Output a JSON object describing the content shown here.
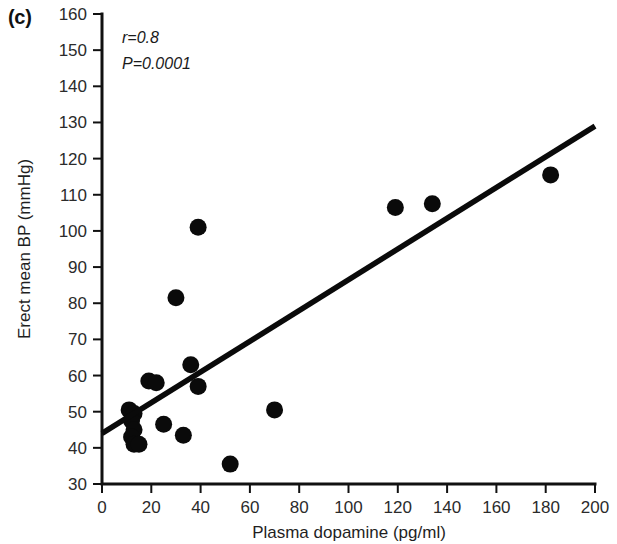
{
  "panel": {
    "label": "(c)"
  },
  "annotations": {
    "correlation": "r=0.8",
    "pvalue": "P=0.0001"
  },
  "axes": {
    "x": {
      "label": "Plasma dopamine (pg/ml)",
      "ticks": [
        "0",
        "20",
        "40",
        "60",
        "80",
        "100",
        "120",
        "140",
        "160",
        "180",
        "200"
      ],
      "min": 0,
      "max": 200,
      "step": 20
    },
    "y": {
      "label": "Erect mean BP (mmHg)",
      "ticks": [
        "30",
        "40",
        "50",
        "60",
        "70",
        "80",
        "90",
        "100",
        "110",
        "120",
        "130",
        "140",
        "150",
        "160"
      ],
      "min": 30,
      "max": 160,
      "step": 10
    }
  },
  "colors": {
    "axis": "#111111",
    "point": "#0a0a0a",
    "fit_line": "#0a0a0a",
    "background": "#ffffff"
  },
  "chart_data": {
    "type": "scatter",
    "title": "",
    "xlabel": "Plasma dopamine (pg/ml)",
    "ylabel": "Erect mean BP (mmHg)",
    "xlim": [
      0,
      200
    ],
    "ylim": [
      30,
      160
    ],
    "grid": false,
    "legend": null,
    "annotations": [
      "r=0.8",
      "P=0.0001"
    ],
    "points": [
      {
        "x": 11,
        "y": 50.5
      },
      {
        "x": 13,
        "y": 49.5
      },
      {
        "x": 12,
        "y": 47.5
      },
      {
        "x": 13,
        "y": 45.0
      },
      {
        "x": 12,
        "y": 43.0
      },
      {
        "x": 13,
        "y": 41.0
      },
      {
        "x": 15,
        "y": 41.0
      },
      {
        "x": 19,
        "y": 58.5
      },
      {
        "x": 22,
        "y": 58.0
      },
      {
        "x": 25,
        "y": 46.5
      },
      {
        "x": 30,
        "y": 81.5
      },
      {
        "x": 33,
        "y": 43.5
      },
      {
        "x": 36,
        "y": 63.0
      },
      {
        "x": 39,
        "y": 101.0
      },
      {
        "x": 39,
        "y": 57.0
      },
      {
        "x": 52,
        "y": 35.5
      },
      {
        "x": 70,
        "y": 50.5
      },
      {
        "x": 119,
        "y": 106.5
      },
      {
        "x": 134,
        "y": 107.5
      },
      {
        "x": 182,
        "y": 115.5
      }
    ],
    "fit_line": {
      "type": "linear-regression",
      "x_start": 0,
      "y_start": 44,
      "x_end": 200,
      "y_end": 129,
      "r": 0.8,
      "p": 0.0001
    }
  }
}
